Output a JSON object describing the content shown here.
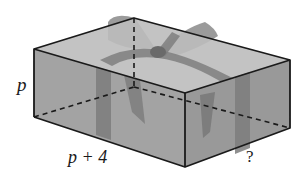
{
  "diagram": {
    "type": "rectangular-prism",
    "labels": {
      "height": "p",
      "length": "p + 4",
      "width": "?"
    },
    "colors": {
      "box_face": "#9a9a9a",
      "box_top": "#b8b8b8",
      "ribbon": "#6e6e6e",
      "edge": "#1a1a1a"
    }
  }
}
